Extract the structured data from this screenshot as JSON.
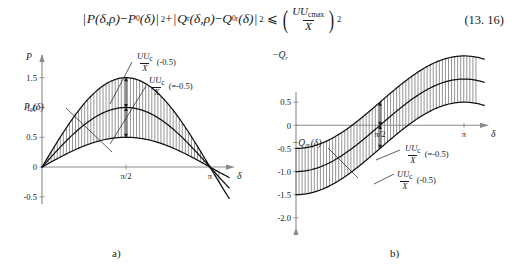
{
  "equation": {
    "lhs_term1_open": "|",
    "lhs_term1_p": "P",
    "lhs_term1_args": "(δ,ρ)",
    "minus": "−",
    "lhs_term1_p0": "P",
    "lhs_term1_p0_sub": "0",
    "lhs_term1_p0_args": "(δ)",
    "close_sq": "|",
    "sq": "2",
    "plus": "+",
    "lhs_term2_q": "Q",
    "lhs_term2_q_sub": "r",
    "lhs_term2_args": "(δ,ρ)",
    "lhs_term2_q0": "Q",
    "lhs_term2_q0_sub": "0r",
    "lhs_term2_q0_args": "(δ)",
    "relation": "⩽",
    "rhs_num": "UU",
    "rhs_num_sub": "cmax",
    "rhs_den": "X",
    "rhs_exp": "2",
    "number": "(13. 16)"
  },
  "chart_data": [
    {
      "id": "a",
      "type": "line",
      "caption": "a)",
      "ylabel": "P",
      "xlabel": "δ",
      "yticks": [
        1.5,
        1.0,
        0.5,
        0,
        -0.5
      ],
      "yticklabels": [
        "1.5",
        "1.0",
        "0.5",
        "0",
        "-0.5"
      ],
      "xticks": [
        1.5707963,
        3.1415927
      ],
      "xticklabels": [
        "π/2",
        "π"
      ],
      "xlim": [
        0,
        3.665
      ],
      "ylim": [
        -0.62,
        1.78
      ],
      "grid": false,
      "series": [
        {
          "name": "upper-bound",
          "label": "",
          "kind": "sine",
          "amplitude": 1.5,
          "offset": 0.0
        },
        {
          "name": "P0(delta)",
          "label": "P₀(δ)",
          "kind": "sine",
          "amplitude": 1.0,
          "offset": 0.0
        },
        {
          "name": "lower-bound",
          "label": "",
          "kind": "sine",
          "amplitude": 0.5,
          "offset": 0.0
        }
      ],
      "hatch": {
        "between": [
          "upper-bound",
          "lower-bound"
        ],
        "style": "vertical-lines"
      },
      "annotations": [
        {
          "name": "upper-gap",
          "num": "UU",
          "num_sub": "c",
          "den": "X",
          "tail": "(-0.5)",
          "at_x": 1.5707963
        },
        {
          "name": "lower-gap",
          "num": "UU",
          "num_sub": "c",
          "den": "X",
          "tail": "(=-0.5)",
          "at_x": 1.5707963
        }
      ],
      "curve_label": "P₀(δ)"
    },
    {
      "id": "b",
      "type": "line",
      "caption": "b)",
      "ylabel": "−Q",
      "ylabel_sub": "r",
      "xlabel": "δ",
      "yticks": [
        -2.0,
        -1.5,
        -1.0,
        -0.5,
        0,
        0.5
      ],
      "yticklabels": [
        "-2.0",
        "-1.5",
        "-1.0",
        "-0.5",
        "0",
        "0.5"
      ],
      "xticks": [
        1.5707963,
        3.1415927
      ],
      "xticklabels": [
        "π/2",
        "π"
      ],
      "xlim": [
        0,
        3.665
      ],
      "ylim": [
        0.72,
        -2.35
      ],
      "grid": false,
      "series": [
        {
          "name": "upper-bound",
          "label": "",
          "kind": "neg-cosine",
          "amplitude": 1.0,
          "offset": -0.5
        },
        {
          "name": "Q0r(delta)",
          "label": "−Q₀ᵣ(δ)",
          "kind": "neg-cosine",
          "amplitude": 1.0,
          "offset": 0.0
        },
        {
          "name": "lower-bound",
          "label": "",
          "kind": "neg-cosine",
          "amplitude": 1.0,
          "offset": 0.5
        }
      ],
      "hatch": {
        "between": [
          "upper-bound",
          "lower-bound"
        ],
        "style": "vertical-lines"
      },
      "annotations": [
        {
          "name": "upper-gap",
          "num": "UU",
          "num_sub": "c",
          "den": "X",
          "tail": "(=-0.5)",
          "at_x": 1.5707963
        },
        {
          "name": "lower-gap",
          "num": "UU",
          "num_sub": "c",
          "den": "X",
          "tail": "(-0.5)",
          "at_x": 1.5707963
        }
      ],
      "curve_label": "−Q₀ᵣ(δ)"
    }
  ],
  "colors": {
    "ink": "#1a1a1a",
    "axis": "#8a8a8a",
    "hatch": "#3d3d3d",
    "curve": "#111111"
  }
}
